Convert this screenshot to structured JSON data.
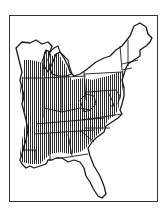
{
  "map": {
    "subject": "Eastern United States range map",
    "legend_visible": false,
    "colors": {
      "background": "#ffffff",
      "outline": "#1a1a1a",
      "hatch": "#2a2a2a",
      "frame": "#333333"
    },
    "hatching": {
      "pattern": "vertical-lines",
      "spacing_px": 2
    },
    "regions_hatched": [
      "southern Wisconsin",
      "Illinois",
      "Indiana",
      "Lower Michigan (south)",
      "Ohio (west)",
      "Kentucky",
      "Tennessee",
      "Mississippi",
      "Alabama",
      "Georgia (north/central)",
      "South Carolina (inland)",
      "North Carolina (west/central)",
      "Virginia",
      "Maryland",
      "Delaware",
      "New Jersey",
      "eastern Pennsylvania",
      "Louisiana (east)"
    ],
    "regions_unhatched": [
      "northern Wisconsin",
      "Upper Michigan",
      "New York",
      "New England",
      "West Virginia (part)",
      "western Pennsylvania",
      "Florida",
      "coastal Georgia",
      "coastal South Carolina",
      "eastern North Carolina"
    ]
  }
}
